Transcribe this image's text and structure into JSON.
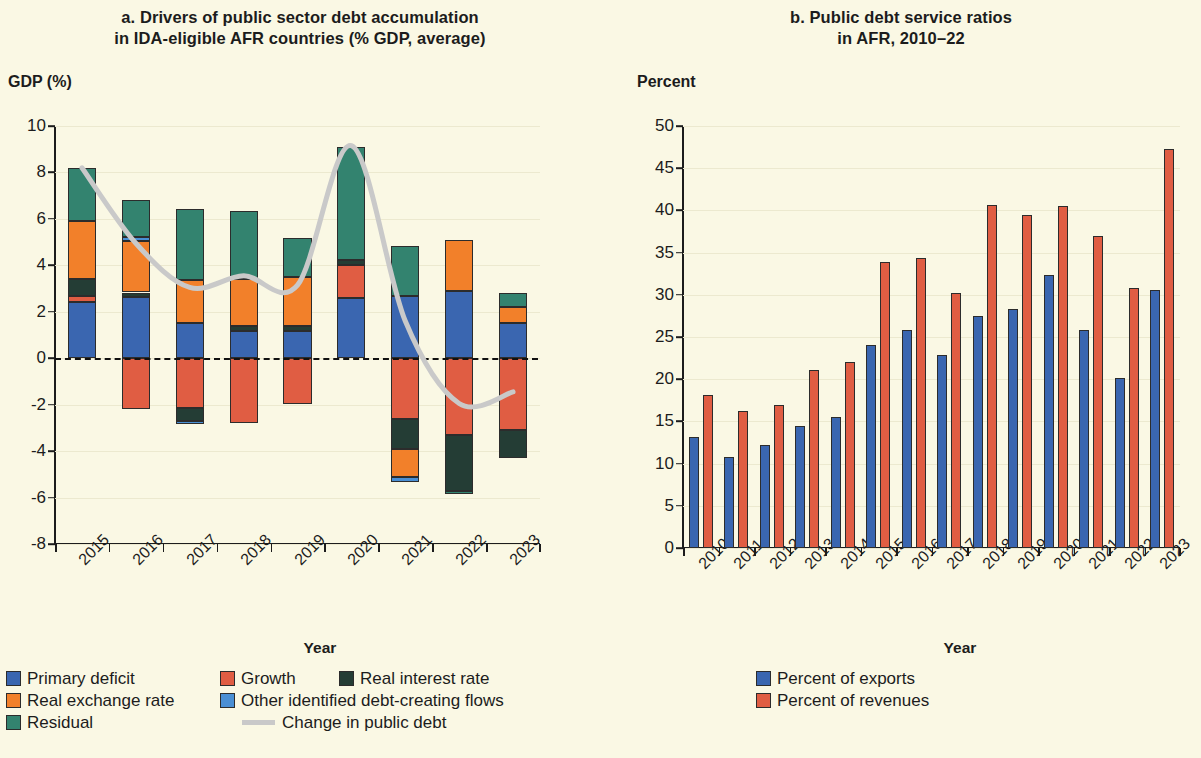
{
  "panel_a": {
    "title": "a. Drivers of public sector debt accumulation\nin IDA-eligible AFR countries (% GDP, average)",
    "title_line1": "a. Drivers of public sector debt accumulation",
    "title_line2": "in IDA-eligible AFR countries (% GDP, average)",
    "ylabel": "GDP (%)",
    "xlabel": "Year"
  },
  "panel_b": {
    "title_line1": "b. Public debt service ratios",
    "title_line2": "in AFR, 2010–22",
    "ylabel": "Percent",
    "xlabel": "Year"
  },
  "colors": {
    "primary_deficit": "#3a66b0",
    "growth": "#e05d43",
    "real_interest_rate": "#243d35",
    "real_exchange_rate": "#f2802a",
    "other_flows": "#4a8fd4",
    "residual": "#33836f",
    "change_in_public_debt": "#c9c9c9",
    "percent_of_exports": "#3a66b0",
    "percent_of_revenues": "#e05d43",
    "background": "#faf8e4",
    "axis": "#1c1c1c",
    "grid": "#ece9cf"
  },
  "legend_a": [
    {
      "label": "Primary deficit",
      "color_key": "primary_deficit",
      "type": "swatch"
    },
    {
      "label": "Growth",
      "color_key": "growth",
      "type": "swatch"
    },
    {
      "label": "Real interest rate",
      "color_key": "real_interest_rate",
      "type": "swatch"
    },
    {
      "label": "Real exchange rate",
      "color_key": "real_exchange_rate",
      "type": "swatch"
    },
    {
      "label": "Other identified debt-creating flows",
      "color_key": "other_flows",
      "type": "swatch"
    },
    {
      "label": "Residual",
      "color_key": "residual",
      "type": "swatch"
    },
    {
      "label": "Change in public debt",
      "color_key": "change_in_public_debt",
      "type": "line"
    }
  ],
  "legend_b": [
    {
      "label": "Percent of exports",
      "color_key": "percent_of_exports",
      "type": "swatch"
    },
    {
      "label": "Percent of revenues",
      "color_key": "percent_of_revenues",
      "type": "swatch"
    }
  ],
  "chart_data": [
    {
      "type": "bar",
      "id": "panel_a",
      "subtype": "stacked-bar-with-line",
      "title": "a. Drivers of public sector debt accumulation in IDA-eligible AFR countries (% GDP, average)",
      "xlabel": "Year",
      "ylabel": "GDP (%)",
      "ylim": [
        -8,
        10
      ],
      "yticks": [
        -8,
        -6,
        -4,
        -2,
        0,
        2,
        4,
        6,
        8,
        10
      ],
      "ytick_labels": [
        "-8",
        "-6",
        "-4",
        "-2",
        "0",
        "2",
        "4",
        "6",
        "8",
        "10"
      ],
      "grid": true,
      "legend_position": "below",
      "categories": [
        "2015",
        "2016",
        "2017",
        "2018",
        "2019",
        "2020",
        "2021",
        "2022",
        "2023"
      ],
      "series": [
        {
          "name": "Primary deficit",
          "color_key": "primary_deficit",
          "values": [
            2.42,
            2.65,
            1.52,
            1.18,
            1.18,
            2.6,
            2.7,
            2.9,
            1.5
          ]
        },
        {
          "name": "Growth",
          "color_key": "growth",
          "values": [
            0.28,
            -2.2,
            -2.15,
            -2.8,
            -1.95,
            1.4,
            -2.6,
            -3.3,
            -3.1
          ]
        },
        {
          "name": "Real interest rate",
          "color_key": "real_interest_rate",
          "values": [
            0.7,
            0.18,
            -0.55,
            0.22,
            0.2,
            0.25,
            -1.3,
            -2.4,
            -1.2
          ]
        },
        {
          "name": "Real exchange rate",
          "color_key": "real_exchange_rate",
          "values": [
            2.5,
            2.2,
            1.85,
            2.0,
            2.1,
            0.0,
            -1.2,
            2.2,
            0.7
          ]
        },
        {
          "name": "Other identified debt-creating flows",
          "color_key": "other_flows",
          "values": [
            0.0,
            0.2,
            -0.15,
            0.0,
            0.0,
            0.0,
            -0.25,
            0.0,
            0.0
          ]
        },
        {
          "name": "Residual",
          "color_key": "residual",
          "values": [
            2.3,
            1.6,
            3.05,
            2.95,
            1.7,
            4.85,
            2.15,
            -0.15,
            0.6
          ]
        }
      ],
      "line_series": {
        "name": "Change in public debt",
        "color_key": "change_in_public_debt",
        "values": [
          8.2,
          4.95,
          3.05,
          3.55,
          3.15,
          9.15,
          1.6,
          -1.95,
          -1.45
        ]
      },
      "bar_totals_positive": [
        8.2,
        6.63,
        5.3,
        6.43,
        5.08,
        9.1,
        4.85,
        5.1,
        2.8
      ],
      "bar_totals_negative": [
        0,
        -2.2,
        -2.35,
        -2.8,
        -2.3,
        0,
        -5.35,
        -5.85,
        -4.3
      ]
    },
    {
      "type": "bar",
      "id": "panel_b",
      "subtype": "grouped-bar",
      "title": "b. Public debt service ratios in AFR, 2010–22",
      "xlabel": "Year",
      "ylabel": "Percent",
      "ylim": [
        0,
        50
      ],
      "yticks": [
        0,
        5,
        10,
        15,
        20,
        25,
        30,
        35,
        40,
        45,
        50
      ],
      "ytick_labels": [
        "0",
        "5",
        "10",
        "15",
        "20",
        "25",
        "30",
        "35",
        "40",
        "45",
        "50"
      ],
      "grid": true,
      "legend_position": "below",
      "categories": [
        "2010",
        "2011",
        "2012",
        "2013",
        "2014",
        "2015",
        "2016",
        "2017",
        "2018",
        "2019",
        "2020",
        "2021",
        "2022",
        "2023"
      ],
      "series": [
        {
          "name": "Percent of exports",
          "color_key": "percent_of_exports",
          "values": [
            13.1,
            10.8,
            12.2,
            14.5,
            15.5,
            24.0,
            25.8,
            22.9,
            27.5,
            28.3,
            32.3,
            25.8,
            20.1,
            30.6
          ]
        },
        {
          "name": "Percent of revenues",
          "color_key": "percent_of_revenues",
          "values": [
            18.1,
            16.2,
            16.9,
            21.1,
            22.0,
            33.9,
            34.4,
            30.2,
            40.6,
            39.4,
            40.5,
            37.0,
            30.8,
            47.3
          ]
        }
      ]
    }
  ]
}
